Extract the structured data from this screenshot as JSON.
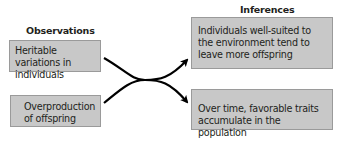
{
  "diagram": {
    "columns": {
      "observations": {
        "heading": "Observations",
        "items": [
          "Heritable variations in individuals",
          "Overproduction of offspring"
        ]
      },
      "inferences": {
        "heading": "Inferences",
        "items": [
          "Individuals well-suited to the environment tend to leave more offspring",
          "Over time, favorable traits accumulate in the population"
        ]
      }
    },
    "connections": [
      {
        "from": "observations.items.0",
        "to": "inferences.items.1"
      },
      {
        "from": "observations.items.1",
        "to": "inferences.items.0"
      }
    ],
    "colors": {
      "box_fill": "#c8c8c8",
      "box_border": "#9a9a9a",
      "arrow": "#000000",
      "text": "#231f20"
    }
  }
}
